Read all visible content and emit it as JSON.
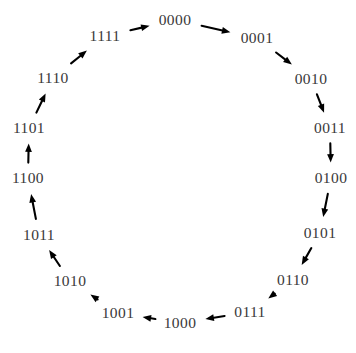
{
  "diagram": {
    "type": "directed-cycle",
    "direction": "clockwise",
    "node_count": 16,
    "text_color": "#3a3a3a",
    "arrow_color": "#000000",
    "background_color": "#ffffff",
    "center": {
      "x": 178,
      "y": 172
    },
    "label_radius": 150,
    "nodes": [
      {
        "label": "0000",
        "angle_deg": 270,
        "x": 175,
        "y": 20
      },
      {
        "label": "0001",
        "angle_deg": 292.5,
        "x": 257,
        "y": 38
      },
      {
        "label": "0010",
        "angle_deg": 315,
        "x": 311,
        "y": 79
      },
      {
        "label": "0011",
        "angle_deg": 337.5,
        "x": 330,
        "y": 128
      },
      {
        "label": "0100",
        "angle_deg": 0,
        "x": 331,
        "y": 178
      },
      {
        "label": "0101",
        "angle_deg": 22.5,
        "x": 320,
        "y": 233
      },
      {
        "label": "0110",
        "angle_deg": 45,
        "x": 293,
        "y": 280
      },
      {
        "label": "0111",
        "angle_deg": 67.5,
        "x": 250,
        "y": 312
      },
      {
        "label": "1000",
        "angle_deg": 90,
        "x": 180,
        "y": 323
      },
      {
        "label": "1001",
        "angle_deg": 112.5,
        "x": 118,
        "y": 313
      },
      {
        "label": "1010",
        "angle_deg": 135,
        "x": 70,
        "y": 281
      },
      {
        "label": "1011",
        "angle_deg": 157.5,
        "x": 39,
        "y": 235
      },
      {
        "label": "1100",
        "angle_deg": 180,
        "x": 28,
        "y": 178
      },
      {
        "label": "1101",
        "angle_deg": 202.5,
        "x": 29,
        "y": 128
      },
      {
        "label": "1110",
        "angle_deg": 225,
        "x": 53,
        "y": 78
      },
      {
        "label": "1111",
        "angle_deg": 247.5,
        "x": 105,
        "y": 36
      }
    ],
    "edges": [
      {
        "from": "0000",
        "to": "0001"
      },
      {
        "from": "0001",
        "to": "0010"
      },
      {
        "from": "0010",
        "to": "0011"
      },
      {
        "from": "0011",
        "to": "0100"
      },
      {
        "from": "0100",
        "to": "0101"
      },
      {
        "from": "0101",
        "to": "0110"
      },
      {
        "from": "0110",
        "to": "0111"
      },
      {
        "from": "0111",
        "to": "1000"
      },
      {
        "from": "1000",
        "to": "1001"
      },
      {
        "from": "1001",
        "to": "1010"
      },
      {
        "from": "1010",
        "to": "1011"
      },
      {
        "from": "1011",
        "to": "1100"
      },
      {
        "from": "1100",
        "to": "1101"
      },
      {
        "from": "1101",
        "to": "1110"
      },
      {
        "from": "1110",
        "to": "1111"
      },
      {
        "from": "1111",
        "to": "0000"
      }
    ]
  }
}
